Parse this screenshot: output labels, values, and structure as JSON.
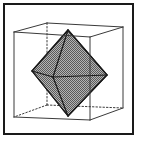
{
  "figure": {
    "title": "Octahedron inscribed in a cube",
    "background": "#ffffff",
    "frame": {
      "x": 4,
      "y": 4,
      "width": 129,
      "height": 130,
      "stroke": "#1a1a1a",
      "stroke_width": 2
    },
    "cube": {
      "stroke": "#3a3a3a",
      "stroke_width": 1,
      "hidden_dash": "1.5,2",
      "front_face": [
        [
          14,
          32
        ],
        [
          90,
          37
        ],
        [
          90,
          120
        ],
        [
          14,
          117
        ]
      ],
      "back_face": [
        [
          47,
          23
        ],
        [
          123,
          27
        ],
        [
          123,
          108
        ],
        [
          47,
          105
        ]
      ],
      "visible_edges": [
        [
          [
            14,
            32
          ],
          [
            90,
            37
          ]
        ],
        [
          [
            90,
            37
          ],
          [
            90,
            120
          ]
        ],
        [
          [
            90,
            120
          ],
          [
            14,
            117
          ]
        ],
        [
          [
            14,
            117
          ],
          [
            14,
            32
          ]
        ],
        [
          [
            14,
            32
          ],
          [
            47,
            23
          ]
        ],
        [
          [
            47,
            23
          ],
          [
            123,
            27
          ]
        ],
        [
          [
            123,
            27
          ],
          [
            90,
            37
          ]
        ],
        [
          [
            123,
            27
          ],
          [
            123,
            108
          ]
        ],
        [
          [
            123,
            108
          ],
          [
            90,
            120
          ]
        ]
      ],
      "hidden_edges": [
        [
          [
            47,
            23
          ],
          [
            47,
            105
          ]
        ],
        [
          [
            47,
            105
          ],
          [
            14,
            117
          ]
        ],
        [
          [
            47,
            105
          ],
          [
            123,
            108
          ]
        ]
      ]
    },
    "octahedron": {
      "fill": "#8c8c8c",
      "fill_pattern": "checker",
      "stroke": "#1a1a1a",
      "stroke_width": 1.2,
      "vertices": {
        "top": [
          68,
          30
        ],
        "left": [
          32,
          71
        ],
        "right": [
          107,
          75
        ],
        "bottom": [
          68,
          116
        ],
        "front": [
          53,
          77
        ]
      },
      "outline": [
        [
          68,
          30
        ],
        [
          107,
          75
        ],
        [
          68,
          116
        ],
        [
          32,
          71
        ]
      ],
      "edges": [
        [
          "top",
          "left"
        ],
        [
          "top",
          "right"
        ],
        [
          "top",
          "front"
        ],
        [
          "left",
          "front"
        ],
        [
          "front",
          "right"
        ],
        [
          "left",
          "bottom"
        ],
        [
          "right",
          "bottom"
        ],
        [
          "front",
          "bottom"
        ]
      ]
    }
  }
}
